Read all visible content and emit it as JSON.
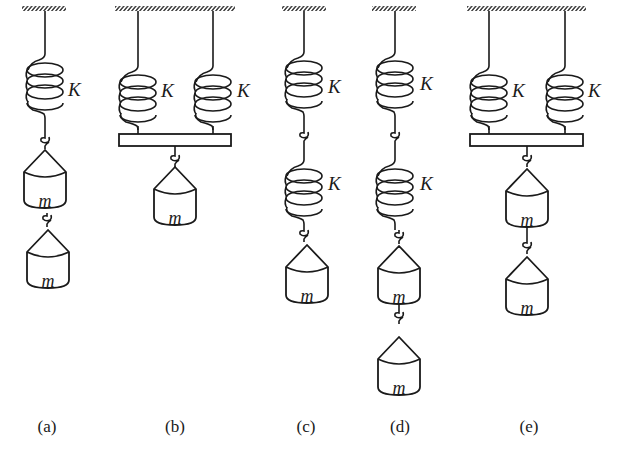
{
  "figure": {
    "colors": {
      "ink": "#1a1a1a",
      "background": "#ffffff"
    },
    "spring_label": "K",
    "mass_label": "m",
    "panels": [
      {
        "id": "a",
        "caption": "(a)",
        "springs": "single",
        "spring_labels": [
          "K"
        ],
        "masses": [
          "m",
          "m"
        ]
      },
      {
        "id": "b",
        "caption": "(b)",
        "springs": "parallel",
        "spring_labels": [
          "K",
          "K"
        ],
        "masses": [
          "m"
        ]
      },
      {
        "id": "c",
        "caption": "(c)",
        "springs": "series",
        "spring_labels": [
          "K",
          "K"
        ],
        "masses": [
          "m"
        ]
      },
      {
        "id": "d",
        "caption": "(d)",
        "springs": "series",
        "spring_labels": [
          "K",
          "K"
        ],
        "masses": [
          "m",
          "m"
        ]
      },
      {
        "id": "e",
        "caption": "(e)",
        "springs": "parallel",
        "spring_labels": [
          "K",
          "K"
        ],
        "masses": [
          "m",
          "m"
        ]
      }
    ]
  }
}
